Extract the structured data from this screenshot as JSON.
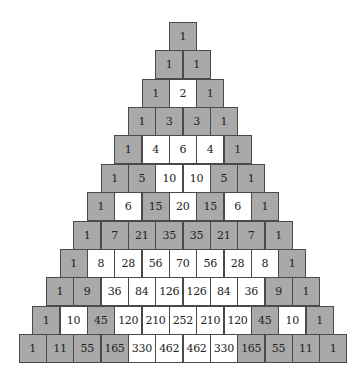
{
  "diagram": {
    "colors": {
      "odd": "#a9a9a9",
      "even": "#ffffff",
      "border": "#4a4a4a"
    },
    "rows": [
      [
        1
      ],
      [
        1,
        1
      ],
      [
        1,
        2,
        1
      ],
      [
        1,
        3,
        3,
        1
      ],
      [
        1,
        4,
        6,
        4,
        1
      ],
      [
        1,
        5,
        10,
        10,
        5,
        1
      ],
      [
        1,
        6,
        15,
        20,
        15,
        6,
        1
      ],
      [
        1,
        7,
        21,
        35,
        35,
        21,
        7,
        1
      ],
      [
        1,
        8,
        28,
        56,
        70,
        56,
        28,
        8,
        1
      ],
      [
        1,
        9,
        36,
        84,
        126,
        126,
        84,
        36,
        9,
        1
      ],
      [
        1,
        10,
        45,
        120,
        210,
        252,
        210,
        120,
        45,
        10,
        1
      ],
      [
        1,
        11,
        55,
        165,
        330,
        462,
        462,
        330,
        165,
        55,
        11,
        1
      ]
    ]
  }
}
